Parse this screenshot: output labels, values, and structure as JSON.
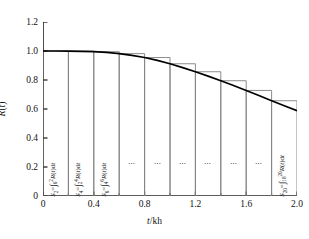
{
  "chart_data": {
    "type": "area",
    "title": "",
    "xlabel": "t/kh",
    "ylabel": "R(t)",
    "xlim": [
      0,
      2.0
    ],
    "ylim": [
      0,
      1.2
    ],
    "grid": false,
    "legend": null,
    "x_ticks": [
      "0",
      "0.4",
      "0.8",
      "1.2",
      "1.6",
      "2.0"
    ],
    "x_tick_values": [
      0,
      0.4,
      0.8,
      1.2,
      1.6,
      2.0
    ],
    "x_minor_ticks": [
      0.2,
      0.6,
      1.0,
      1.4,
      1.8
    ],
    "y_ticks": [
      "0",
      "0.2",
      "0.4",
      "0.6",
      "0.8",
      "1.0",
      "1.2"
    ],
    "y_tick_values": [
      0,
      0.2,
      0.4,
      0.6,
      0.8,
      1.0,
      1.2
    ],
    "curve_name": "R(t)",
    "curve_x": [
      0,
      0.1,
      0.2,
      0.3,
      0.4,
      0.5,
      0.6,
      0.7,
      0.8,
      0.9,
      1.0,
      1.1,
      1.2,
      1.3,
      1.4,
      1.5,
      1.6,
      1.7,
      1.8,
      1.9,
      2.0
    ],
    "curve_y": [
      1.0,
      1.0,
      0.999,
      0.998,
      0.995,
      0.99,
      0.982,
      0.97,
      0.955,
      0.935,
      0.912,
      0.885,
      0.857,
      0.827,
      0.795,
      0.762,
      0.728,
      0.693,
      0.657,
      0.622,
      0.588
    ],
    "bars": [
      {
        "index": 1,
        "x0": 0.0,
        "x1": 0.2,
        "height": 1.0
      },
      {
        "index": 2,
        "x0": 0.2,
        "x1": 0.4,
        "height": 0.999
      },
      {
        "index": 3,
        "x0": 0.4,
        "x1": 0.6,
        "height": 0.995
      },
      {
        "index": 4,
        "x0": 0.6,
        "x1": 0.8,
        "height": 0.982
      },
      {
        "index": 5,
        "x0": 0.8,
        "x1": 1.0,
        "height": 0.955
      },
      {
        "index": 6,
        "x0": 1.0,
        "x1": 1.2,
        "height": 0.912
      },
      {
        "index": 7,
        "x0": 1.2,
        "x1": 1.4,
        "height": 0.857
      },
      {
        "index": 8,
        "x0": 1.4,
        "x1": 1.6,
        "height": 0.795
      },
      {
        "index": 9,
        "x0": 1.6,
        "x1": 1.8,
        "height": 0.728
      },
      {
        "index": 10,
        "x0": 1.8,
        "x1": 2.0,
        "height": 0.657
      }
    ],
    "annotations": [
      {
        "bar": 1,
        "kind": "formula",
        "symbol": "S",
        "subscript": "2",
        "lower": "0",
        "upper": "2",
        "integrand": "R(t)dt",
        "text": "S2 = ∫0^2 R(t)dt"
      },
      {
        "bar": 2,
        "kind": "formula",
        "symbol": "S",
        "subscript": "4",
        "lower": "2",
        "upper": "4",
        "integrand": "R(t)dt",
        "text": "S4 = ∫2^4 R(t)dt"
      },
      {
        "bar": 3,
        "kind": "formula",
        "symbol": "S",
        "subscript": "6",
        "lower": "4",
        "upper": "6",
        "integrand": "R(t)dt",
        "text": "S6 = ∫4^6 R(t)dt"
      },
      {
        "bar": 4,
        "kind": "ellipsis",
        "text": "⋯"
      },
      {
        "bar": 5,
        "kind": "ellipsis",
        "text": "⋯"
      },
      {
        "bar": 6,
        "kind": "ellipsis",
        "text": "⋯"
      },
      {
        "bar": 7,
        "kind": "ellipsis",
        "text": "⋯"
      },
      {
        "bar": 8,
        "kind": "ellipsis",
        "text": "⋯"
      },
      {
        "bar": 9,
        "kind": "ellipsis",
        "text": "⋯"
      },
      {
        "bar": 10,
        "kind": "formula",
        "symbol": "S",
        "subscript": "20",
        "lower": "18",
        "upper": "20",
        "integrand": "R(t)dt",
        "text": "S20 = ∫18^20 R(t)dt"
      }
    ],
    "colors": {
      "curve": "#000000",
      "bar_outline": "#808080",
      "axis": "#000000",
      "background": "#ffffff",
      "text": "#111111"
    }
  }
}
